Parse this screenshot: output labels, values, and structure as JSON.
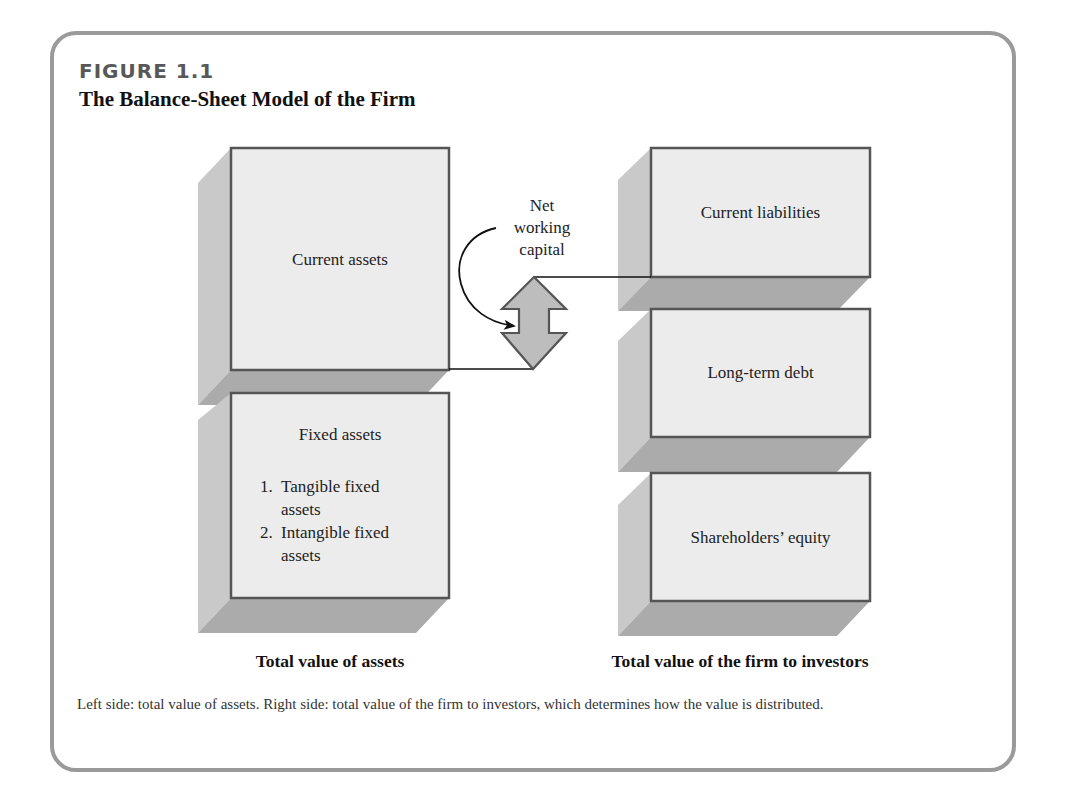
{
  "figure": {
    "label": "FIGURE 1.1",
    "title": "The Balance-Sheet Model of the Firm"
  },
  "left_column": {
    "boxes": [
      {
        "label": "Current assets"
      },
      {
        "label": "Fixed assets",
        "list": [
          {
            "num": "1.",
            "lines": [
              "Tangible fixed",
              "assets"
            ]
          },
          {
            "num": "2.",
            "lines": [
              "Intangible fixed",
              "assets"
            ]
          }
        ]
      }
    ],
    "caption": "Total value of assets"
  },
  "connector": {
    "label_lines": [
      "Net",
      "working",
      "capital"
    ],
    "icons": [
      "double-headed-arrow-icon",
      "curved-arrow-icon"
    ]
  },
  "right_column": {
    "boxes": [
      {
        "label": "Current liabilities"
      },
      {
        "label": "Long-term debt"
      },
      {
        "label": "Shareholders’ equity"
      }
    ],
    "caption": "Total value of the firm to investors"
  },
  "caption": "Left side: total value of assets. Right side: total value of the firm to investors, which determines how the value is distributed.",
  "colors": {
    "frame_border": "#9a9a9a",
    "box_front": "#ececec",
    "box_side": "#c9c9c9",
    "box_bottom": "#ababab",
    "box_border": "#555555",
    "arrow_fill": "#bdbdbd",
    "label_gray": "#585858"
  }
}
